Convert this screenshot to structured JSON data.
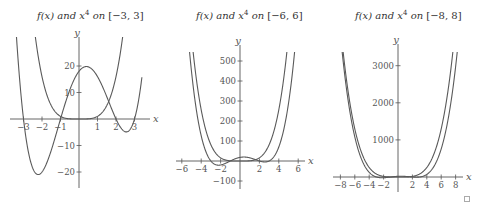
{
  "charts": [
    {
      "title_fx": "f(x)",
      "title_and": "and",
      "title_x": "x",
      "title_exp": "4",
      "title_on": "on",
      "title_interval": "[−3, 3]"
    },
    {
      "title_fx": "f(x)",
      "title_and": "and",
      "title_x": "x",
      "title_exp": "4",
      "title_on": "on",
      "title_interval": "[−6, 6]"
    },
    {
      "title_fx": "f(x)",
      "title_and": "and",
      "title_x": "x",
      "title_exp": "4",
      "title_on": "on",
      "title_interval": "[−8, 8]"
    }
  ],
  "chart_data": [
    {
      "type": "line",
      "title": "f(x) and x^4 on [-3, 3]",
      "xlabel": "x",
      "ylabel": "y",
      "xlim": [
        -3,
        3
      ],
      "ylim": [
        -25,
        25
      ],
      "xticks": [
        -3,
        -2,
        -1,
        1,
        2,
        3
      ],
      "xtick_labels": [
        "−3",
        "−2",
        "−1",
        "1",
        "2",
        "3"
      ],
      "yticks": [
        -20,
        -10,
        10,
        20
      ],
      "ytick_labels": [
        "−20",
        "−10",
        "10",
        "20"
      ],
      "grid": false,
      "series": [
        {
          "name": "f(x) = (x+3)(x+1)(x−2)(x−3)",
          "roots": [
            -3,
            -1,
            2,
            3
          ],
          "points": [
            [
              -3,
              0
            ],
            [
              -2.2,
              -21
            ],
            [
              -1,
              0
            ],
            [
              0,
              18
            ],
            [
              0.5,
              19.7
            ],
            [
              2,
              0
            ],
            [
              2.6,
              -4.5
            ],
            [
              3,
              0
            ]
          ]
        },
        {
          "name": "x^4",
          "points": [
            [
              -2.2,
              23.4
            ],
            [
              -1,
              1
            ],
            [
              0,
              0
            ],
            [
              1,
              1
            ],
            [
              2.2,
              23.4
            ]
          ]
        }
      ]
    },
    {
      "type": "line",
      "title": "f(x) and x^4 on [-6, 6]",
      "xlabel": "x",
      "ylabel": "y",
      "xlim": [
        -6,
        6
      ],
      "ylim": [
        -100,
        500
      ],
      "xticks": [
        -6,
        -4,
        -2,
        2,
        4,
        6
      ],
      "xtick_labels": [
        "−6",
        "−4",
        "−2",
        "2",
        "4",
        "6"
      ],
      "yticks": [
        -100,
        100,
        200,
        300,
        400,
        500
      ],
      "ytick_labels": [
        "−100",
        "100",
        "200",
        "300",
        "400",
        "500"
      ],
      "grid": false,
      "series": [
        {
          "name": "f(x)",
          "points": [
            [
              -5.5,
              420
            ],
            [
              -3,
              0
            ],
            [
              -2.2,
              -21
            ],
            [
              0,
              18
            ],
            [
              2.6,
              -4.5
            ],
            [
              5.8,
              530
            ]
          ]
        },
        {
          "name": "x^4",
          "points": [
            [
              -4.9,
              576
            ],
            [
              -2,
              16
            ],
            [
              0,
              0
            ],
            [
              2,
              16
            ],
            [
              4.9,
              576
            ]
          ]
        }
      ]
    },
    {
      "type": "line",
      "title": "f(x) and x^4 on [-8, 8]",
      "xlabel": "x",
      "ylabel": "y",
      "xlim": [
        -8,
        8
      ],
      "ylim": [
        0,
        3000
      ],
      "xticks": [
        -8,
        -6,
        -4,
        -2,
        2,
        4,
        6,
        8
      ],
      "xtick_labels": [
        "−8",
        "−6",
        "−4",
        "−2",
        "2",
        "4",
        "6",
        "8"
      ],
      "yticks": [
        1000,
        2000,
        3000
      ],
      "ytick_labels": [
        "1000",
        "2000",
        "3000"
      ],
      "grid": false,
      "series": [
        {
          "name": "f(x)",
          "points": [
            [
              -7.6,
              3300
            ],
            [
              -4,
              0
            ],
            [
              0,
              18
            ],
            [
              4,
              0
            ],
            [
              8.1,
              3300
            ]
          ]
        },
        {
          "name": "x^4",
          "points": [
            [
              -7.6,
              3336
            ],
            [
              0,
              0
            ],
            [
              7.6,
              3336
            ]
          ]
        }
      ]
    }
  ],
  "corner_box": "□"
}
